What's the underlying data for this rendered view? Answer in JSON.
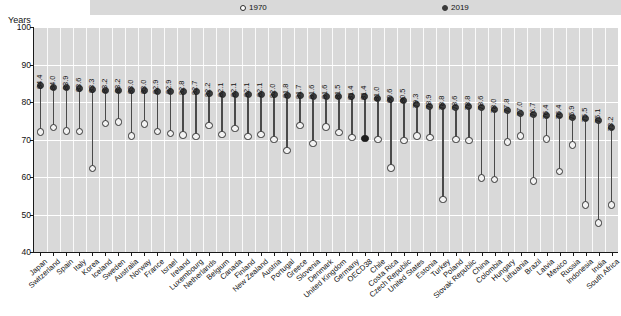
{
  "axis": {
    "y_title": "Years"
  },
  "legend": [
    {
      "label": "1970",
      "marker": "hollow-circle-icon"
    },
    {
      "label": "2019",
      "marker": "filled-circle-icon"
    }
  ],
  "chart_data": {
    "type": "scatter",
    "title": "",
    "subtitle": "",
    "xlabel": "",
    "ylabel": "Years",
    "ylim": [
      40,
      100
    ],
    "yticks": [
      40,
      50,
      60,
      70,
      80,
      90,
      100
    ],
    "grid": true,
    "legend_position": "top",
    "categories": [
      "Japan",
      "Switzerland",
      "Spain",
      "Italy",
      "Korea",
      "Iceland",
      "Sweden",
      "Australia",
      "Norway",
      "France",
      "Israel",
      "Ireland",
      "Luxembourg",
      "Netherlands",
      "Belgium",
      "Canada",
      "Finland",
      "New Zealand",
      "Austria",
      "Portugal",
      "Greece",
      "Slovenia",
      "Denmark",
      "United Kingdom",
      "Germany",
      "OECD38",
      "Chile",
      "Costa Rica",
      "Czech Republic",
      "United States",
      "Estonia",
      "Turkey",
      "Poland",
      "Slovak Republic",
      "China",
      "Colombia",
      "Hungary",
      "Lithuania",
      "Brazil",
      "Latvia",
      "Mexico",
      "Russia",
      "Indonesia",
      "India",
      "South Africa"
    ],
    "series": [
      {
        "name": "2019",
        "values": [
          84.4,
          84.0,
          83.9,
          83.6,
          83.3,
          83.2,
          83.2,
          83.0,
          83.0,
          82.9,
          82.9,
          82.8,
          82.7,
          82.2,
          82.1,
          82.1,
          82.1,
          82.1,
          82.0,
          81.8,
          81.7,
          81.6,
          81.6,
          81.5,
          81.4,
          81.4,
          81.0,
          80.6,
          80.5,
          79.3,
          78.9,
          78.8,
          78.6,
          78.8,
          78.6,
          78.0,
          77.8,
          77.0,
          76.7,
          76.4,
          76.4,
          75.9,
          75.5,
          75.1,
          73.2
        ],
        "labels": [
          "84.4",
          "84.0",
          "83.9",
          "83.6",
          "83.3",
          "83.2",
          "83.2",
          "83.0",
          "83.0",
          "82.9",
          "82.9",
          "82.8",
          "82.7",
          "82.2",
          "82.1",
          "82.1",
          "82.1",
          "82.1",
          "82.0",
          "81.8",
          "81.7",
          "81.6",
          "81.6",
          "81.5",
          "81.4",
          "81.4",
          "81.0",
          "80.6",
          "80.5",
          "79.3",
          "78.9",
          "78.8",
          "78.6",
          "78.8",
          "78.6",
          "78.0",
          "77.8",
          "77.0",
          "76.7",
          "76.4",
          "76.4",
          "75.9",
          "75.5",
          "75.1",
          "73.2"
        ]
      },
      {
        "name": "1970",
        "values": [
          72.0,
          73.2,
          72.3,
          72.1,
          62.3,
          74.3,
          74.7,
          71.0,
          74.1,
          72.2,
          71.6,
          71.2,
          70.8,
          73.7,
          71.4,
          72.9,
          70.8,
          71.4,
          70.0,
          67.1,
          73.8,
          69.0,
          73.3,
          71.9,
          70.6,
          70.3,
          70.0,
          62.4,
          69.8,
          70.9,
          70.5,
          54.0,
          70.0,
          69.8,
          59.8,
          59.4,
          69.3,
          71.0,
          58.9,
          70.2,
          61.5,
          68.5,
          52.5,
          47.7,
          52.6
        ]
      }
    ],
    "value_labels_note": "2019 values are printed vertically above each 2019 marker",
    "oecd_aggregate": {
      "name": "OECD38",
      "value_2019": "81.0",
      "marker_1970_filled": true
    },
    "tail_values_2019": [
      "71.8",
      "69.7",
      "64.2"
    ],
    "tail_categories": [
      "Russia",
      "Indonesia",
      "India",
      "South Africa"
    ]
  },
  "final_points": {
    "note": "right-most labelled series points",
    "items": [
      {
        "category": "Russia",
        "v2019": "73.2"
      },
      {
        "category": "Indonesia",
        "v2019": "71.8"
      },
      {
        "category": "India",
        "v2019": "69.7"
      },
      {
        "category": "South Africa",
        "v2019": "64.2"
      }
    ]
  }
}
